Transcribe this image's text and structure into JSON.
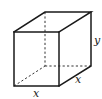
{
  "figure": {
    "type": "rectangular-prism",
    "labels": {
      "front_bottom": "x",
      "side_bottom": "x",
      "height": "y"
    },
    "colors": {
      "line": "#1a1a1a",
      "background": "#ffffff"
    }
  }
}
